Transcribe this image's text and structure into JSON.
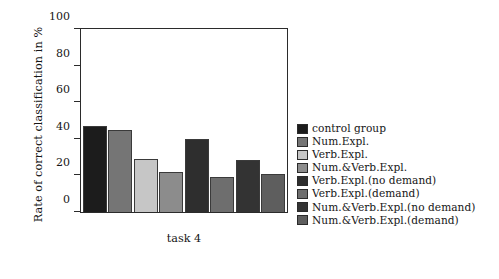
{
  "chart_data": {
    "type": "bar",
    "title": "",
    "subtitle": "",
    "xlabel": "task 4",
    "ylabel": "Rate of correct classification in %",
    "ylim": [
      0,
      100
    ],
    "yticks": [
      0,
      20,
      40,
      60,
      80,
      100
    ],
    "ytick_labels": [
      "0",
      "20",
      "40",
      "60",
      "80",
      "100"
    ],
    "grid": false,
    "legend_position": "right",
    "categories": [
      "control group",
      "Num.Expl.",
      "Verb.Expl.",
      "Num.&Verb.Expl.",
      "Verb.Expl.(no demand)",
      "Verb.Expl.(demand)",
      "Num.&Verb.Expl.(no demand)",
      "Num.&Verb.Expl.(demand)"
    ],
    "values": [
      47,
      45,
      29,
      22,
      40,
      19,
      28.5,
      21
    ],
    "colors": [
      "#1c1c1c",
      "#757575",
      "#c6c6c6",
      "#8c8c8c",
      "#2e2e2e",
      "#6e6e6e",
      "#333333",
      "#5e5e5e"
    ],
    "bar_edge_color": "#3a3a3a",
    "axis_color": "#2b2b2b"
  },
  "legend": {
    "items": [
      {
        "label": "control group",
        "color": "#1c1c1c"
      },
      {
        "label": "Num.Expl.",
        "color": "#757575"
      },
      {
        "label": "Verb.Expl.",
        "color": "#c6c6c6"
      },
      {
        "label": "Num.&Verb.Expl.",
        "color": "#8c8c8c"
      },
      {
        "label": "Verb.Expl.(no demand)",
        "color": "#2e2e2e"
      },
      {
        "label": "Verb.Expl.(demand)",
        "color": "#6e6e6e"
      },
      {
        "label": "Num.&Verb.Expl.(no demand)",
        "color": "#333333"
      },
      {
        "label": "Num.&Verb.Expl.(demand)",
        "color": "#5e5e5e"
      }
    ]
  }
}
